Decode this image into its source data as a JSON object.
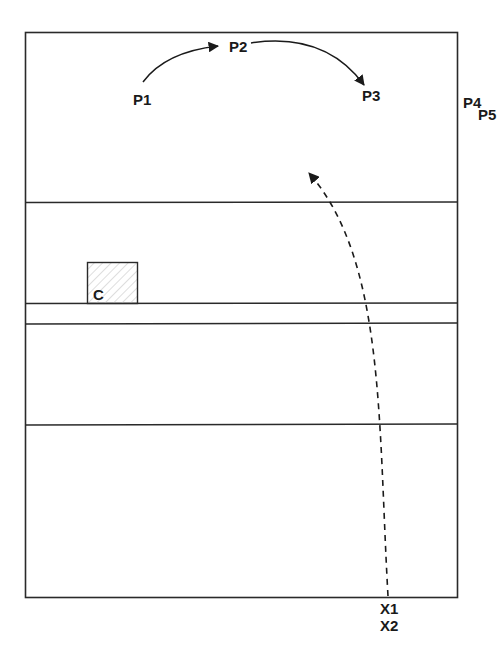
{
  "diagram": {
    "labels": {
      "p1": "P1",
      "p2": "P2",
      "p3": "P3",
      "p4": "P4",
      "p5": "P5",
      "c": "C",
      "x1": "X1",
      "x2": "X2"
    },
    "colors": {
      "line": "#2a2a2a",
      "hatch": "#c8c8c8",
      "background": "#ffffff"
    },
    "zones": [
      "zone-1",
      "zone-2",
      "zone-3",
      "zone-4",
      "zone-5"
    ]
  }
}
